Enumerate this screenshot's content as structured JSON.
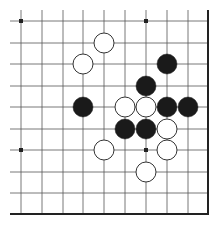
{
  "board": {
    "type": "go-diagram-fragment",
    "columns_x": [
      21,
      42,
      63,
      83,
      104,
      125,
      146,
      167,
      188
    ],
    "rows_y": [
      21,
      43,
      64,
      86,
      107,
      129,
      150,
      172,
      193
    ],
    "line_extend_start": 10,
    "right_edge_x": 208,
    "bottom_edge_y": 214,
    "stone_radius": 10,
    "colors": {
      "background": "#ffffff",
      "line": "#555555",
      "edge": "#222222",
      "black_stone": "#1a1a1a",
      "white_stone_fill": "#ffffff",
      "white_stone_stroke": "#333333",
      "star_point": "#222222"
    },
    "star_points": [
      {
        "col": 0,
        "row": 0
      },
      {
        "col": 6,
        "row": 0
      },
      {
        "col": 0,
        "row": 6
      },
      {
        "col": 6,
        "row": 6
      }
    ],
    "stones": [
      {
        "color": "white",
        "col": 4,
        "row": 1
      },
      {
        "color": "white",
        "col": 3,
        "row": 2
      },
      {
        "color": "black",
        "col": 7,
        "row": 2
      },
      {
        "color": "black",
        "col": 6,
        "row": 3
      },
      {
        "color": "black",
        "col": 3,
        "row": 4
      },
      {
        "color": "white",
        "col": 5,
        "row": 4
      },
      {
        "color": "white",
        "col": 6,
        "row": 4
      },
      {
        "color": "black",
        "col": 7,
        "row": 4
      },
      {
        "color": "black",
        "col": 8,
        "row": 4
      },
      {
        "color": "black",
        "col": 5,
        "row": 5
      },
      {
        "color": "black",
        "col": 6,
        "row": 5
      },
      {
        "color": "white",
        "col": 7,
        "row": 5
      },
      {
        "color": "white",
        "col": 4,
        "row": 6
      },
      {
        "color": "white",
        "col": 7,
        "row": 6
      },
      {
        "color": "white",
        "col": 6,
        "row": 7
      }
    ]
  }
}
